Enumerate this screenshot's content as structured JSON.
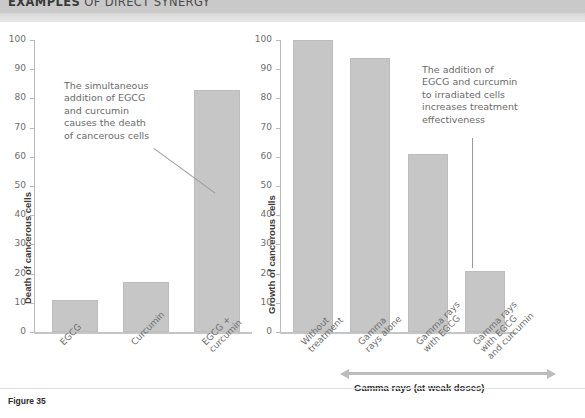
{
  "header": {
    "title_bold": "EXAMPLES",
    "title_rest": " OF DIRECT SYNERGY"
  },
  "figure": {
    "caption": "Figure 35"
  },
  "annotations": {
    "bottom_arrow_label": "Gamma rays (at weak doses)"
  },
  "chart_data": [
    {
      "type": "bar",
      "title": "",
      "id": "left",
      "ylabel": "Death of cancerous cells",
      "xlabel": "",
      "categories": [
        "EGCG",
        "Curcumin",
        "EGCG +\ncurcumin"
      ],
      "values": [
        11,
        17,
        83
      ],
      "ylim": [
        0,
        100
      ],
      "yticks": [
        0,
        10,
        20,
        30,
        40,
        50,
        60,
        70,
        80,
        90,
        100
      ],
      "grid": false,
      "legend": "none",
      "bar_color": "#c6c6c6",
      "annotation": "The simultaneous\naddition of EGCG\nand curcumin\ncauses the death\nof cancerous cells"
    },
    {
      "type": "bar",
      "title": "",
      "id": "right",
      "ylabel": "Growth of cancerous cells",
      "xlabel": "",
      "categories": [
        "Without\ntreatment",
        "Gamma\nrays alone",
        "Gamma rays\nwith EGCG",
        "Gamma rays\nwith EGCG\nand curcumin"
      ],
      "values": [
        100,
        94,
        61,
        21
      ],
      "ylim": [
        0,
        100
      ],
      "yticks": [
        0,
        10,
        20,
        30,
        40,
        50,
        60,
        70,
        80,
        90,
        100
      ],
      "grid": false,
      "legend": "none",
      "bar_color": "#c6c6c6",
      "annotation": "The addition of\nEGCG and curcumin\nto irradiated cells\nincreases treatment\neffectiveness"
    }
  ]
}
